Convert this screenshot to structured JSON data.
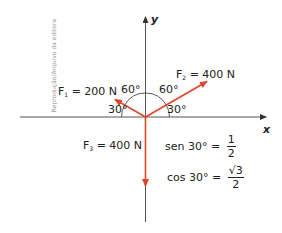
{
  "credit": "Reprodução/Arquivo da editora",
  "axes": {
    "x_label": "x",
    "y_label": "y"
  },
  "forces": [
    {
      "id": "F1",
      "symbol": "F",
      "subscript": "1",
      "eq": " = 200 N",
      "magnitude": 200,
      "unit": "N",
      "angle_from_negative_x_deg": 30,
      "color": "#e0442a"
    },
    {
      "id": "F2",
      "symbol": "F",
      "subscript": "2",
      "eq": " = 400 N",
      "magnitude": 400,
      "unit": "N",
      "angle_from_positive_x_deg": 30,
      "color": "#e0442a"
    },
    {
      "id": "F3",
      "symbol": "F",
      "subscript": "3",
      "eq": " = 400 N",
      "magnitude": 400,
      "unit": "N",
      "direction": "negative y",
      "color": "#e0442a"
    }
  ],
  "angles": {
    "f1_to_x": "30°",
    "f1_to_y": "60°",
    "f2_to_y": "60°",
    "f2_to_x": "30°"
  },
  "formulas": {
    "sen": {
      "lhs": "sen 30° =",
      "num": "1",
      "den": "2"
    },
    "cos": {
      "lhs": "cos 30° =",
      "num": "√3",
      "den": "2"
    }
  },
  "colors": {
    "vector": "#e0442a",
    "axis": "#555555",
    "arc": "#333333"
  }
}
